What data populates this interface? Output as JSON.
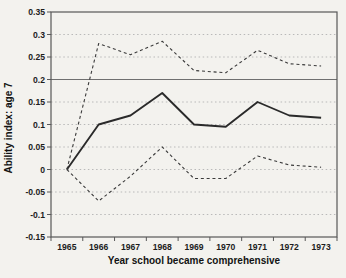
{
  "figure": {
    "background": "#f3f2ee"
  },
  "chart_data": {
    "type": "line",
    "title": "",
    "xlabel": "Year school became comprehensive",
    "ylabel": "Ability index: age 7",
    "categories": [
      "1965",
      "1966",
      "1967",
      "1968",
      "1969",
      "1970",
      "1971",
      "1972",
      "1973"
    ],
    "series": [
      {
        "name": "ability-index-estimate",
        "style": "solid",
        "values": [
          0,
          0.1,
          0.12,
          0.17,
          0.1,
          0.095,
          0.15,
          0.12,
          0.115
        ]
      },
      {
        "name": "upper-confidence-band",
        "style": "dashed",
        "values": [
          0,
          0.28,
          0.255,
          0.285,
          0.22,
          0.215,
          0.265,
          0.235,
          0.23
        ]
      },
      {
        "name": "lower-confidence-band",
        "style": "dashed",
        "values": [
          0,
          -0.07,
          -0.015,
          0.05,
          -0.02,
          -0.02,
          0.03,
          0.01,
          0.005
        ]
      }
    ],
    "ylim": [
      -0.15,
      0.35
    ],
    "yticks": [
      0.35,
      0.3,
      0.25,
      0.2,
      0.15,
      0.1,
      0.05,
      0,
      -0.05,
      -0.1,
      -0.15
    ],
    "ytick_labels": [
      "0.35",
      "0.3",
      "0.25",
      "0.2",
      "0.15",
      "0.1",
      "0.05",
      "0",
      "-0.05",
      "-0.1",
      "-0.15"
    ],
    "reference_line_y": 0.2,
    "grid": "horizontal-dotted",
    "legend": "none",
    "colors": {
      "solid_line": "#2a2a2a",
      "dashed_line": "#3a3a3a",
      "grid": "#b9b9b9",
      "reference_line": "#6f6f6f",
      "frame": "#585858",
      "text": "#1c1c1c",
      "background": "#f3f2ee"
    }
  }
}
